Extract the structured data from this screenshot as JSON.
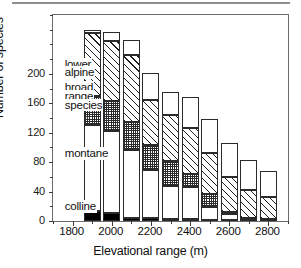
{
  "chart_data": {
    "type": "bar",
    "subtype": "stacked",
    "title": "",
    "xlabel": "Elevational range (m)",
    "ylabel": "Number of species",
    "xlim": [
      1700,
      2900
    ],
    "ylim": [
      0,
      280
    ],
    "yticks": [
      0,
      40,
      80,
      120,
      160,
      200
    ],
    "ytick_labels": [
      "0",
      "40",
      "80",
      "120",
      "160",
      "200"
    ],
    "yminor_step": 20,
    "xticks": [
      1800,
      2000,
      2200,
      2400,
      2600,
      2800
    ],
    "xtick_labels": [
      "1800",
      "2000",
      "2200",
      "2400",
      "2600",
      "2800"
    ],
    "xminor_step": 100,
    "grid": false,
    "legend_position": "in-plot-left",
    "categories": [
      1900,
      2000,
      2100,
      2200,
      2300,
      2400,
      2500,
      2600,
      2700,
      2800
    ],
    "series": [
      {
        "name": "colline",
        "fill": "solid",
        "values": [
          13,
          11,
          4,
          4,
          3,
          3,
          2,
          1,
          0,
          0
        ]
      },
      {
        "name": "montane",
        "fill": "dots",
        "values": [
          117,
          111,
          92,
          66,
          45,
          43,
          17,
          8,
          3,
          2
        ]
      },
      {
        "name": "broad range species",
        "fill": "check",
        "values": [
          40,
          41,
          38,
          34,
          34,
          18,
          18,
          3,
          1,
          1
        ]
      },
      {
        "name": "lower alpine",
        "fill": "hatch",
        "values": [
          85,
          82,
          92,
          60,
          62,
          62,
          55,
          48,
          38,
          30
        ]
      },
      {
        "name": "upper",
        "fill": "white",
        "values": [
          4,
          12,
          20,
          37,
          32,
          43,
          47,
          46,
          41,
          35
        ]
      }
    ],
    "totals": [
      259,
      257,
      246,
      201,
      176,
      169,
      139,
      106,
      83,
      68
    ],
    "annotations": [
      {
        "text": "lower",
        "x": 1755,
        "y": 214
      },
      {
        "text": "alpine",
        "x": 1755,
        "y": 202
      },
      {
        "text": "broad",
        "x": 1755,
        "y": 182
      },
      {
        "text": "range",
        "x": 1755,
        "y": 170
      },
      {
        "text": "species",
        "x": 1755,
        "y": 158
      },
      {
        "text": "montane",
        "x": 1755,
        "y": 92
      },
      {
        "text": "colline",
        "x": 1755,
        "y": 20
      }
    ]
  },
  "axis": {
    "y_title": "Number of species",
    "x_title": "Elevational range (m)"
  }
}
